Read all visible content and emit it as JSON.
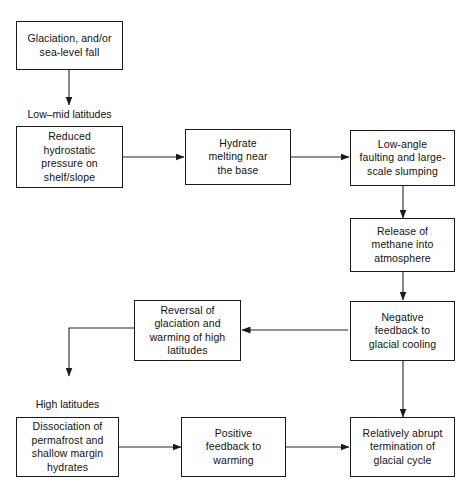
{
  "diagram": {
    "nodes": {
      "glaciation": "Glaciation, and/or\nsea-level fall",
      "reduced_hydrostatic": "Reduced\nhydrostatic\npressure on\nshelf/slope",
      "hydrate_melting": "Hydrate\nmelting near\nthe base",
      "low_angle_faulting": "Low-angle\nfaulting and large-\nscale slumping",
      "methane_release": "Release of\nmethane into\natmosphere",
      "negative_feedback": "Negative\nfeedback to\nglacial cooling",
      "reversal": "Reversal of\nglaciation and\nwarming of high\nlatitudes",
      "dissociation": "Dissociation of\npermafrost and\nshallow margin\nhydrates",
      "positive_feedback": "Positive\nfeedback to\nwarming",
      "termination": "Relatively abrupt\ntermination of\nglacial cycle"
    },
    "region_labels": {
      "low_mid_latitudes": "Low–mid latitudes",
      "high_latitudes": "High latitudes"
    },
    "colors": {
      "stroke": "#1a1a1a",
      "text": "#111111",
      "background": "#ffffff"
    }
  }
}
